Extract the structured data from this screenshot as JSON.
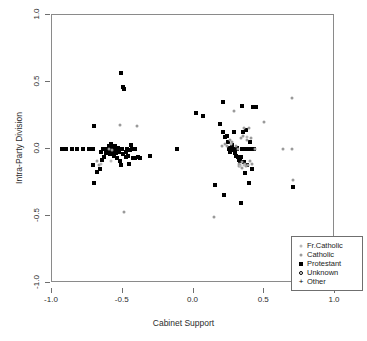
{
  "chart_data": {
    "type": "scatter",
    "title": "",
    "xlabel": "Cabinet Support",
    "ylabel": "Intra-Party Division",
    "xlim": [
      -1.0,
      1.0
    ],
    "ylim": [
      -1.0,
      1.0
    ],
    "xticks": [
      "-1.0",
      "-0.5",
      "0.0",
      "0.5",
      "1.0"
    ],
    "xtick_values": [
      -1.0,
      -0.5,
      0.0,
      0.5,
      1.0
    ],
    "yticks": [
      "-1.0",
      "-0.5",
      "0.0",
      "0.5",
      "1.0"
    ],
    "ytick_values": [
      -1.0,
      -0.5,
      0.0,
      0.5,
      1.0
    ],
    "grid": false,
    "legend_position": "bottom-right",
    "legend": [
      {
        "label": "Fr.Catholic",
        "marker": "dot",
        "color": "#b9b9b9",
        "size": 3
      },
      {
        "label": "Catholic",
        "marker": "dot",
        "color": "#9a9a9a",
        "size": 3
      },
      {
        "label": "Protestant",
        "marker": "square",
        "color": "#000000",
        "size": 5
      },
      {
        "label": "Unknown",
        "marker": "circle",
        "color": "#000000",
        "size": 5
      },
      {
        "label": "Other",
        "marker": "plus",
        "color": "#000000",
        "size": 6
      }
    ],
    "series": [
      {
        "name": "Protestant",
        "marker": "square",
        "color": "#000000",
        "points": [
          [
            -0.93,
            0.0
          ],
          [
            -0.9,
            0.0
          ],
          [
            -0.86,
            0.0
          ],
          [
            -0.82,
            0.0
          ],
          [
            -0.78,
            0.0
          ],
          [
            -0.74,
            0.0
          ],
          [
            -0.71,
            0.0
          ],
          [
            -0.705,
            0.17
          ],
          [
            -0.7,
            -0.25
          ],
          [
            -0.71,
            -0.12
          ],
          [
            -0.68,
            -0.17
          ],
          [
            -0.66,
            -0.15
          ],
          [
            -0.65,
            -0.08
          ],
          [
            -0.655,
            -0.02
          ],
          [
            -0.64,
            0.0
          ],
          [
            -0.635,
            -0.06
          ],
          [
            -0.62,
            0.0
          ],
          [
            -0.615,
            -0.03
          ],
          [
            -0.6,
            0.02
          ],
          [
            -0.6,
            -0.01
          ],
          [
            -0.595,
            0.0
          ],
          [
            -0.59,
            -0.04
          ],
          [
            -0.585,
            0.04
          ],
          [
            -0.58,
            0.0
          ],
          [
            -0.575,
            -0.02
          ],
          [
            -0.57,
            0.01
          ],
          [
            -0.565,
            -0.05
          ],
          [
            -0.56,
            0.0
          ],
          [
            -0.555,
            0.02
          ],
          [
            -0.55,
            -0.03
          ],
          [
            -0.545,
            0.0
          ],
          [
            -0.54,
            -0.07
          ],
          [
            -0.535,
            0.01
          ],
          [
            -0.53,
            -0.02
          ],
          [
            -0.525,
            0.0
          ],
          [
            -0.52,
            -0.09
          ],
          [
            -0.515,
            0.57
          ],
          [
            -0.51,
            -0.12
          ],
          [
            -0.505,
            0.0
          ],
          [
            -0.5,
            -0.04
          ],
          [
            -0.495,
            0.46
          ],
          [
            -0.49,
            0.45
          ],
          [
            -0.48,
            -0.02
          ],
          [
            -0.475,
            -0.06
          ],
          [
            -0.47,
            0.0
          ],
          [
            -0.465,
            -0.05
          ],
          [
            -0.455,
            -0.11
          ],
          [
            -0.45,
            -0.01
          ],
          [
            -0.44,
            0.03
          ],
          [
            -0.435,
            0.0
          ],
          [
            -0.425,
            -0.07
          ],
          [
            -0.415,
            0.0
          ],
          [
            -0.41,
            -0.07
          ],
          [
            -0.39,
            -0.06
          ],
          [
            -0.375,
            -0.07
          ],
          [
            -0.305,
            -0.05
          ],
          [
            -0.12,
            0.0
          ],
          [
            0.02,
            0.27
          ],
          [
            0.07,
            0.25
          ],
          [
            0.15,
            -0.27
          ],
          [
            0.19,
            0.19
          ],
          [
            0.205,
            0.13
          ],
          [
            0.21,
            0.35
          ],
          [
            0.215,
            -0.34
          ],
          [
            0.22,
            0.09
          ],
          [
            0.235,
            0.1
          ],
          [
            0.245,
            0.05
          ],
          [
            0.25,
            0.0
          ],
          [
            0.255,
            0.01
          ],
          [
            0.26,
            -0.02
          ],
          [
            0.265,
            0.0
          ],
          [
            0.27,
            0.03
          ],
          [
            0.275,
            -0.01
          ],
          [
            0.28,
            0.0
          ],
          [
            0.285,
            0.13
          ],
          [
            0.29,
            -0.03
          ],
          [
            0.295,
            0.0
          ],
          [
            0.3,
            -0.05
          ],
          [
            0.305,
            0.01
          ],
          [
            0.31,
            0.0
          ],
          [
            0.315,
            -0.06
          ],
          [
            0.32,
            -0.08
          ],
          [
            0.325,
            -0.07
          ],
          [
            0.33,
            -0.09
          ],
          [
            0.335,
            -0.06
          ],
          [
            0.34,
            0.0
          ],
          [
            0.335,
            -0.4
          ],
          [
            0.345,
            0.32
          ],
          [
            0.35,
            0.13
          ],
          [
            0.355,
            -0.1
          ],
          [
            0.36,
            0.0
          ],
          [
            0.365,
            -0.18
          ],
          [
            0.37,
            0.14
          ],
          [
            0.375,
            -0.12
          ],
          [
            0.38,
            0.0
          ],
          [
            0.39,
            0.0
          ],
          [
            0.395,
            -0.25
          ],
          [
            0.4,
            0.05
          ],
          [
            0.405,
            0.0
          ],
          [
            0.41,
            -0.15
          ],
          [
            0.42,
            0.31
          ],
          [
            0.425,
            0.0
          ],
          [
            0.445,
            0.31
          ],
          [
            0.7,
            -0.28
          ]
        ]
      },
      {
        "name": "Catholic",
        "marker": "dot",
        "color": "#9a9a9a",
        "points": [
          [
            -0.68,
            -0.09
          ],
          [
            -0.665,
            -0.12
          ],
          [
            -0.6,
            0.0
          ],
          [
            -0.575,
            -0.01
          ],
          [
            -0.52,
            0.18
          ],
          [
            -0.49,
            -0.47
          ],
          [
            -0.4,
            0.17
          ],
          [
            0.145,
            -0.51
          ],
          [
            0.2,
            0.02
          ],
          [
            0.225,
            0.04
          ],
          [
            0.24,
            0.02
          ],
          [
            0.255,
            0.07
          ],
          [
            0.27,
            0.05
          ],
          [
            0.285,
            0.28
          ],
          [
            0.3,
            0.02
          ],
          [
            0.315,
            0.0
          ],
          [
            0.32,
            -0.13
          ],
          [
            0.325,
            -0.11
          ],
          [
            0.33,
            -0.12
          ],
          [
            0.335,
            0.08
          ],
          [
            0.34,
            -0.14
          ],
          [
            0.345,
            -0.1
          ],
          [
            0.35,
            0.1
          ],
          [
            0.36,
            0.16
          ],
          [
            0.365,
            -0.11
          ],
          [
            0.37,
            -0.13
          ],
          [
            0.375,
            0.07
          ],
          [
            0.385,
            -0.12
          ],
          [
            0.39,
            0.16
          ],
          [
            0.4,
            -0.09
          ],
          [
            0.405,
            0.08
          ],
          [
            0.41,
            -0.11
          ],
          [
            0.435,
            0.0
          ],
          [
            0.5,
            0.2
          ],
          [
            0.63,
            0.0
          ],
          [
            0.695,
            0.0
          ],
          [
            0.695,
            0.38
          ],
          [
            0.7,
            -0.23
          ]
        ]
      },
      {
        "name": "Fr.Catholic",
        "marker": "dot",
        "color": "#b9b9b9",
        "points": [
          [
            -0.655,
            -0.11
          ],
          [
            -0.585,
            -0.09
          ],
          [
            0.265,
            0.04
          ],
          [
            0.33,
            -0.13
          ],
          [
            0.355,
            -0.12
          ],
          [
            0.38,
            0.09
          ]
        ]
      },
      {
        "name": "Unknown",
        "marker": "circle",
        "color": "#000000",
        "points": []
      },
      {
        "name": "Other",
        "marker": "plus",
        "color": "#000000",
        "points": []
      }
    ]
  }
}
